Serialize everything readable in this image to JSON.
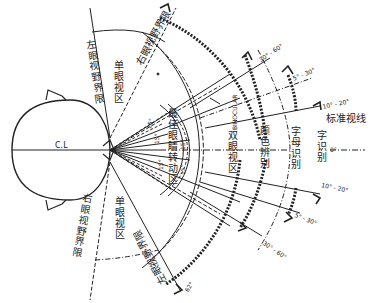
{
  "diagram": {
    "center_line_label": "C.L",
    "standard_sightline_label": "标准视线",
    "zero_deg_label": "0°",
    "boundaries": {
      "left_eye_limit_top": "左眼视野界限",
      "right_eye_limit_top": "右眼视野界限",
      "right_eye_limit_bottom": "右眼视野界限",
      "left_eye_limit_bottom": "左眼视野界限"
    },
    "zones": {
      "monocular_top": "单眼视区",
      "monocular_bottom": "单眼视区",
      "optimal_eye_rotation": "最佳眼睛转动区",
      "binocular": "双眼视区",
      "binocular_en": "BINOCULAR",
      "color_discrimination": "颜色辨别",
      "word_recognition": "字母识别",
      "word_recognition_2": "字识别"
    },
    "angle_labels": {
      "inner_15_a": "15°",
      "inner_15_b": "15°",
      "inner_15_c": "15°",
      "inner_15_d": "15°",
      "inner_15_e": "15°",
      "arrow_30_60_top": "30° - 60°",
      "arrow_5_30_top": "5° - 30°",
      "arrow_10_20_top": "10° - 20°",
      "arrow_10_20_bottom": "10° - 20°",
      "arrow_5_30_bottom": "5° - 30°",
      "arrow_30_60_bottom": "30° - 60°",
      "outer_bottom": "62°"
    },
    "colors": {
      "ink": "#222222",
      "background": "#ffffff"
    }
  }
}
